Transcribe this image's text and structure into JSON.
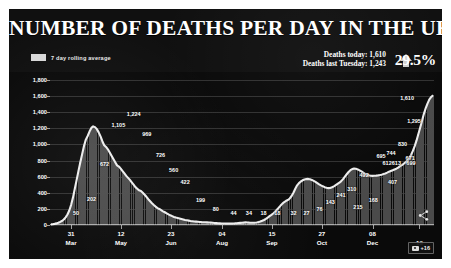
{
  "header": {
    "title": "NUMBER OF DEATHS PER DAY IN THE UK",
    "legend_label": "7 day rolling average",
    "deaths_today": "Deaths today: 1,610",
    "deaths_last_tuesday": "Deaths last Tuesday: 1,243",
    "percent_change": "29.5%",
    "trend_icon": "arrow-up-icon"
  },
  "overlay": {
    "share_icon": "share-icon",
    "photo_count": "+16",
    "camera_icon": "camera-icon"
  },
  "colors": {
    "background": "#0a0a0a",
    "bar": "#4a4a4a",
    "line": "#ededed",
    "text": "#ffffff"
  },
  "chart_data": {
    "type": "bar",
    "title": "NUMBER OF DEATHS PER DAY IN THE UK",
    "xlabel": "",
    "ylabel": "",
    "ylim": [
      0,
      1800
    ],
    "grid": true,
    "legend": [
      "7 day rolling average"
    ],
    "legend_position": "top-left",
    "yticks": [
      "0",
      "200",
      "400",
      "600",
      "800",
      "1,000",
      "1,200",
      "1,400",
      "1,600",
      "1,800"
    ],
    "ytick_values": [
      0,
      200,
      400,
      600,
      800,
      1000,
      1200,
      1400,
      1600,
      1800
    ],
    "xticks": [
      {
        "day": "31",
        "month": "Mar",
        "pos": 0.055
      },
      {
        "day": "12",
        "month": "May",
        "pos": 0.185
      },
      {
        "day": "23",
        "month": "Jun",
        "pos": 0.315
      },
      {
        "day": "04",
        "month": "Aug",
        "pos": 0.448
      },
      {
        "day": "15",
        "month": "Sep",
        "pos": 0.578
      },
      {
        "day": "27",
        "month": "Oct",
        "pos": 0.708
      },
      {
        "day": "08",
        "month": "Dec",
        "pos": 0.84
      },
      {
        "day": "19",
        "month": "",
        "pos": 0.962
      }
    ],
    "series": [
      {
        "name": "7 day rolling average",
        "values": [
          8,
          10,
          14,
          20,
          28,
          38,
          50,
          68,
          95,
          130,
          180,
          250,
          340,
          450,
          560,
          672,
          780,
          880,
          980,
          1060,
          1105,
          1160,
          1205,
          1224,
          1215,
          1190,
          1150,
          1100,
          1040,
          990,
          969,
          940,
          900,
          860,
          820,
          780,
          740,
          726,
          700,
          670,
          640,
          610,
          585,
          560,
          530,
          500,
          470,
          450,
          430,
          422,
          400,
          375,
          350,
          320,
          295,
          270,
          248,
          228,
          210,
          199,
          185,
          170,
          158,
          145,
          132,
          120,
          110,
          100,
          92,
          86,
          80,
          74,
          68,
          62,
          58,
          54,
          50,
          47,
          44,
          42,
          40,
          38,
          36,
          35,
          34,
          33,
          31,
          29,
          27,
          25,
          23,
          21,
          20,
          19,
          18,
          18,
          18,
          18,
          18,
          19,
          20,
          22,
          24,
          26,
          28,
          30,
          32,
          31,
          29,
          28,
          27,
          28,
          31,
          36,
          43,
          52,
          62,
          76,
          92,
          110,
          126,
          143,
          165,
          190,
          215,
          241,
          265,
          285,
          300,
          310,
          330,
          360,
          400,
          450,
          492,
          520,
          540,
          555,
          565,
          570,
          572,
          568,
          560,
          548,
          535,
          520,
          505,
          492,
          480,
          470,
          462,
          458,
          460,
          468,
          480,
          495,
          510,
          525,
          545,
          570,
          600,
          630,
          658,
          680,
          695,
          700,
          698,
          690,
          678,
          665,
          650,
          635,
          625,
          618,
          612,
          610,
          611,
          613,
          616,
          620,
          625,
          632,
          640,
          650,
          662,
          671,
          680,
          690,
          699,
          712,
          730,
          744,
          760,
          780,
          800,
          830,
          870,
          920,
          980,
          1050,
          1130,
          1210,
          1295,
          1380,
          1450,
          1510,
          1560,
          1590,
          1610
        ]
      }
    ],
    "annotations": [
      {
        "value": "50",
        "x": 0.068,
        "y": 0.055
      },
      {
        "value": "202",
        "x": 0.108,
        "y": 0.15
      },
      {
        "value": "672",
        "x": 0.142,
        "y": 0.395
      },
      {
        "value": "1,105",
        "x": 0.178,
        "y": 0.66
      },
      {
        "value": "1,224",
        "x": 0.218,
        "y": 0.74
      },
      {
        "value": "969",
        "x": 0.252,
        "y": 0.598
      },
      {
        "value": "726",
        "x": 0.288,
        "y": 0.452
      },
      {
        "value": "560",
        "x": 0.322,
        "y": 0.352
      },
      {
        "value": "422",
        "x": 0.352,
        "y": 0.272
      },
      {
        "value": "199",
        "x": 0.392,
        "y": 0.148
      },
      {
        "value": "80",
        "x": 0.432,
        "y": 0.082
      },
      {
        "value": "44",
        "x": 0.478,
        "y": 0.058
      },
      {
        "value": "34",
        "x": 0.518,
        "y": 0.056
      },
      {
        "value": "18",
        "x": 0.556,
        "y": 0.054
      },
      {
        "value": "18",
        "x": 0.592,
        "y": 0.054
      },
      {
        "value": "32",
        "x": 0.634,
        "y": 0.056
      },
      {
        "value": "27",
        "x": 0.668,
        "y": 0.058
      },
      {
        "value": "76",
        "x": 0.702,
        "y": 0.082
      },
      {
        "value": "143",
        "x": 0.73,
        "y": 0.128
      },
      {
        "value": "241",
        "x": 0.758,
        "y": 0.178
      },
      {
        "value": "310",
        "x": 0.786,
        "y": 0.222
      },
      {
        "value": "492",
        "x": 0.818,
        "y": 0.318
      },
      {
        "value": "168",
        "x": 0.842,
        "y": 0.145
      },
      {
        "value": "215",
        "x": 0.802,
        "y": 0.1
      },
      {
        "value": "695",
        "x": 0.862,
        "y": 0.448
      },
      {
        "value": "744",
        "x": 0.888,
        "y": 0.468
      },
      {
        "value": "612",
        "x": 0.878,
        "y": 0.4
      },
      {
        "value": "613",
        "x": 0.902,
        "y": 0.4
      },
      {
        "value": "407",
        "x": 0.892,
        "y": 0.268
      },
      {
        "value": "830",
        "x": 0.918,
        "y": 0.53
      },
      {
        "value": "671",
        "x": 0.938,
        "y": 0.432
      },
      {
        "value": "699",
        "x": 0.94,
        "y": 0.398
      },
      {
        "value": "1,295",
        "x": 0.948,
        "y": 0.688
      },
      {
        "value": "1,610",
        "x": 0.93,
        "y": 0.845
      }
    ]
  }
}
